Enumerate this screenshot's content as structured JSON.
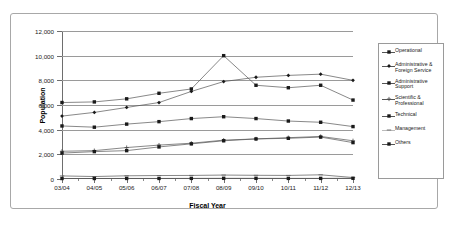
{
  "chart_data": {
    "type": "line",
    "title": "",
    "xlabel": "Fiscal Year",
    "ylabel": "Population",
    "categories": [
      "03/04",
      "04/05",
      "05/06",
      "06/07",
      "07/08",
      "08/09",
      "09/10",
      "10/11",
      "11/12",
      "12/13"
    ],
    "ylim": [
      0,
      12000
    ],
    "ytick_values": [
      0,
      2000,
      4000,
      6000,
      8000,
      10000,
      12000
    ],
    "ytick_labels": [
      "0",
      "2,000",
      "4,000",
      "6,000",
      "8,000",
      "10,000",
      "12,000"
    ],
    "grid": true,
    "legend_position": "right",
    "series": [
      {
        "name": "Operational",
        "marker": "square",
        "values": [
          6200,
          6250,
          6500,
          6950,
          7300,
          10000,
          7600,
          7400,
          7600,
          6400
        ]
      },
      {
        "name": "Administrative & Foreign Service",
        "marker": "diamond",
        "values": [
          5100,
          5400,
          5800,
          6200,
          7100,
          7900,
          8250,
          8400,
          8500,
          8000
        ]
      },
      {
        "name": "Administrative Support",
        "marker": "square",
        "values": [
          4300,
          4200,
          4450,
          4650,
          4900,
          5050,
          4900,
          4700,
          4600,
          4250
        ]
      },
      {
        "name": "Scientific & Professional",
        "marker": "plus",
        "values": [
          2250,
          2300,
          2550,
          2750,
          2900,
          3150,
          3250,
          3350,
          3450,
          3100
        ]
      },
      {
        "name": "Technical",
        "marker": "square",
        "values": [
          2100,
          2220,
          2300,
          2600,
          2850,
          3100,
          3250,
          3300,
          3400,
          2950
        ]
      },
      {
        "name": "Management",
        "marker": "dash",
        "values": [
          250,
          200,
          260,
          280,
          290,
          320,
          300,
          290,
          340,
          120
        ]
      },
      {
        "name": "Others",
        "marker": "square",
        "values": [
          40,
          40,
          45,
          45,
          50,
          55,
          55,
          50,
          50,
          60
        ]
      }
    ]
  },
  "legend": {
    "items": [
      {
        "label": "Operational"
      },
      {
        "label": "Administrative & Foreign Service"
      },
      {
        "label": "Administrative Support"
      },
      {
        "label": "Scientific & Professional"
      },
      {
        "label": "Technical"
      },
      {
        "label": "Management"
      },
      {
        "label": "Others"
      }
    ]
  }
}
